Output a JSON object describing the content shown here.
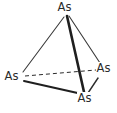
{
  "figure": {
    "kind": "molecular-structure-diagram",
    "molecule_formula": "As4",
    "background_color": "#ffffff",
    "line_color": "#2b2b2b",
    "label_color": "#2b2b2b"
  },
  "atoms": [
    {
      "id": "top",
      "label": "As",
      "x": 66,
      "y": 16
    },
    {
      "id": "left",
      "label": "As",
      "x": 23,
      "y": 76
    },
    {
      "id": "right",
      "label": "As",
      "x": 99,
      "y": 70
    },
    {
      "id": "bottom",
      "label": "As",
      "x": 85,
      "y": 92
    }
  ],
  "bonds": [
    {
      "from": "top",
      "to": "left",
      "style": "solid",
      "width": 1.1,
      "hidden": false
    },
    {
      "from": "top",
      "to": "right",
      "style": "solid",
      "width": 1.1,
      "hidden": false
    },
    {
      "from": "top",
      "to": "bottom",
      "style": "solid",
      "width": 2.6,
      "hidden": false
    },
    {
      "from": "left",
      "to": "bottom",
      "style": "solid",
      "width": 2.0,
      "hidden": false
    },
    {
      "from": "right",
      "to": "bottom",
      "style": "solid",
      "width": 1.4,
      "hidden": false
    },
    {
      "from": "left",
      "to": "right",
      "style": "dashed",
      "width": 1.0,
      "hidden": true
    }
  ],
  "geometry": {
    "top_vertex": {
      "x": 66,
      "y": 17
    },
    "left_vertex": {
      "x": 23,
      "y": 75
    },
    "right_vertex": {
      "x": 99,
      "y": 69
    },
    "bottom_vertex": {
      "x": 85,
      "y": 92
    },
    "dash_pattern": "4 3"
  }
}
